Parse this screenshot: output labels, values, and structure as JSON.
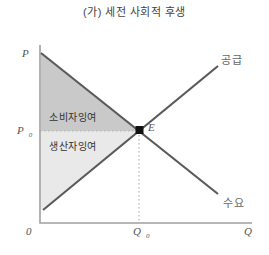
{
  "title": "(가) 세전 사회적 후생",
  "colors": {
    "consumer_surplus_fill": "#c9c9c9",
    "producer_surplus_fill": "#e9e9e9",
    "axis_stroke": "#a0a0a0",
    "curve_stroke": "#5a5a5a",
    "dotted_stroke": "#b5b5b5",
    "equilibrium_point": "#111111"
  },
  "axes": {
    "y_axis_label": "P",
    "x_axis_label": "Q",
    "origin_label": "0",
    "equilibrium_price_main": "P",
    "equilibrium_price_sub": "0",
    "equilibrium_quantity_main": "Q",
    "equilibrium_quantity_sub": "0"
  },
  "curves": {
    "supply_label": "공급",
    "demand_label": "수요"
  },
  "regions": {
    "consumer_surplus_label": "소비자잉여",
    "producer_surplus_label": "생산자잉여"
  },
  "equilibrium": {
    "point_label": "E"
  }
}
